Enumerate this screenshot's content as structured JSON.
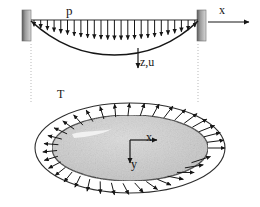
{
  "figure": {
    "background_color": "#ffffff",
    "ink_color": "#161616",
    "support_fill_color": "#8a8a8a",
    "membrane_fill_color": "#c9c9c9"
  },
  "beam_diagram": {
    "load_label": "p",
    "axis_label_x": "x",
    "deflection_label": "z,u",
    "span_start_x": 30,
    "span_end_x": 198,
    "load_line_y": 20,
    "n_load_arrows": 25,
    "max_sag_px": 19,
    "left_support": {
      "x": 22,
      "y": 10,
      "w": 9,
      "h": 30,
      "label": "fixed-support-left"
    },
    "right_support": {
      "x": 197,
      "y": 10,
      "w": 9,
      "h": 30,
      "label": "fixed-support-right"
    },
    "x_axis_arrow": {
      "x1": 208,
      "y1": 22,
      "x2": 252,
      "y2": 22
    },
    "z_axis_arrow": {
      "x1": 138,
      "y1": 47,
      "x2": 138,
      "y2": 70
    }
  },
  "membrane_diagram": {
    "tension_label": "T",
    "axis_label_x": "x",
    "axis_label_y": "y",
    "center": {
      "cx": 130,
      "cy": 148
    },
    "inner_ellipse": {
      "rx": 78,
      "ry": 33
    },
    "outer_ellipse": {
      "rx": 95,
      "ry": 45
    },
    "n_tension_arrows": 36,
    "x_axis_arrow": {
      "x1": 130,
      "y1": 140,
      "x2": 160,
      "y2": 140
    },
    "y_axis_arrow": {
      "x1": 130,
      "y1": 140,
      "x2": 130,
      "y2": 166
    }
  },
  "guide_lines": {
    "left_x": 30,
    "right_x": 198,
    "y_top": 44,
    "y_bottom": 104,
    "style": "dotted"
  }
}
